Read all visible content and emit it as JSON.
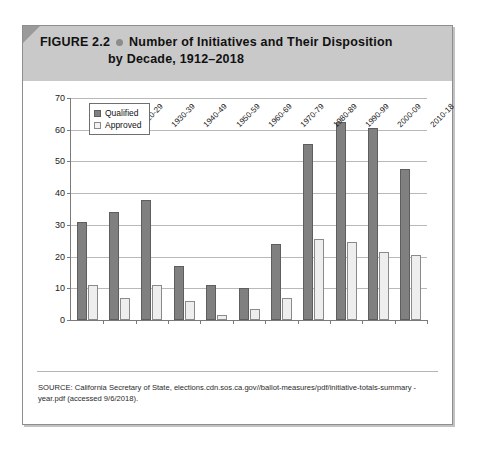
{
  "figure": {
    "label": "FIGURE 2.2",
    "title_line_1": "Number of Initiatives and Their Disposition",
    "title_line_2": "by Decade, 1912–2018",
    "bullet_icon": "filled-circle-icon",
    "band_color": "#c9c9c9"
  },
  "source": {
    "text": "SOURCE: California Secretary of State, elections.cdn.sos.ca.gov//ballot-measures/pdf/initiative-totals-summary -year.pdf (accessed 9/6/2018)."
  },
  "chart_data": {
    "type": "bar",
    "xlabel": "",
    "ylabel": "",
    "ylim": [
      0,
      70
    ],
    "ytick_step": 10,
    "yticks": [
      0,
      10,
      20,
      30,
      40,
      50,
      60,
      70
    ],
    "grid": true,
    "legend_position": "top-left",
    "categories": [
      "1912-19",
      "1920-29",
      "1930-39",
      "1940-49",
      "1950-59",
      "1960-69",
      "1970-79",
      "1980-89",
      "1990-99",
      "2000-09",
      "2010-18"
    ],
    "series": [
      {
        "name": "Qualified",
        "color": "#808080",
        "values": [
          31,
          34,
          38,
          17,
          11,
          10,
          24,
          55.5,
          62.5,
          60.5,
          47.5
        ]
      },
      {
        "name": "Approved",
        "color": "#eeeeee",
        "values": [
          11,
          7,
          11,
          6,
          1.5,
          3.5,
          7,
          25.5,
          24.5,
          21.5,
          20.5
        ]
      }
    ]
  }
}
